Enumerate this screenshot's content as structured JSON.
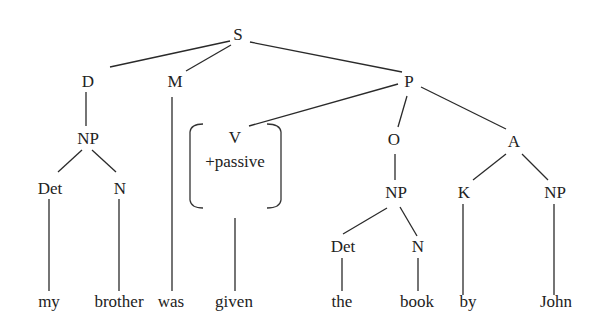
{
  "diagram": {
    "type": "syntax-tree",
    "nodes": {
      "S": {
        "label": "S",
        "x": 238,
        "y": 40
      },
      "D": {
        "label": "D",
        "x": 88,
        "y": 87
      },
      "M": {
        "label": "M",
        "x": 175,
        "y": 87
      },
      "P": {
        "label": "P",
        "x": 409,
        "y": 87
      },
      "NP1": {
        "label": "NP",
        "x": 88,
        "y": 144
      },
      "V": {
        "label": "V",
        "x": 234,
        "y": 140
      },
      "Vfeat": {
        "label": "+passive",
        "x": 234,
        "y": 164
      },
      "O": {
        "label": "O",
        "x": 394,
        "y": 145
      },
      "A": {
        "label": "A",
        "x": 512,
        "y": 147
      },
      "Det1": {
        "label": "Det",
        "x": 49,
        "y": 193
      },
      "N1": {
        "label": "N",
        "x": 120,
        "y": 193
      },
      "NP2": {
        "label": "NP",
        "x": 396,
        "y": 198
      },
      "K": {
        "label": "K",
        "x": 464,
        "y": 198
      },
      "NP3": {
        "label": "NP",
        "x": 555,
        "y": 198
      },
      "Det2": {
        "label": "Det",
        "x": 342,
        "y": 252
      },
      "N2": {
        "label": "N",
        "x": 418,
        "y": 252
      }
    },
    "words": [
      {
        "label": "my",
        "x": 49,
        "y": 307
      },
      {
        "label": "brother",
        "x": 119,
        "y": 307
      },
      {
        "label": "was",
        "x": 171,
        "y": 307
      },
      {
        "label": "given",
        "x": 234,
        "y": 307
      },
      {
        "label": "the",
        "x": 342,
        "y": 307
      },
      {
        "label": "book",
        "x": 417,
        "y": 307
      },
      {
        "label": "by",
        "x": 468,
        "y": 307
      },
      {
        "label": "John",
        "x": 556,
        "y": 307
      }
    ],
    "edges": [
      [
        "S",
        "D"
      ],
      [
        "S",
        "M"
      ],
      [
        "S",
        "P"
      ],
      [
        "D",
        "NP1"
      ],
      [
        "NP1",
        "Det1"
      ],
      [
        "NP1",
        "N1"
      ],
      [
        "P",
        "V"
      ],
      [
        "P",
        "O"
      ],
      [
        "P",
        "A"
      ],
      [
        "O",
        "NP2"
      ],
      [
        "NP2",
        "Det2"
      ],
      [
        "NP2",
        "N2"
      ],
      [
        "A",
        "K"
      ],
      [
        "A",
        "NP3"
      ],
      [
        "Det1",
        "my"
      ],
      [
        "N1",
        "brother"
      ],
      [
        "M",
        "was"
      ],
      [
        "V",
        "given"
      ],
      [
        "Det2",
        "the"
      ],
      [
        "N2",
        "book"
      ],
      [
        "K",
        "by"
      ],
      [
        "NP3",
        "John"
      ]
    ],
    "sentence": "my brother was given the book by John"
  }
}
